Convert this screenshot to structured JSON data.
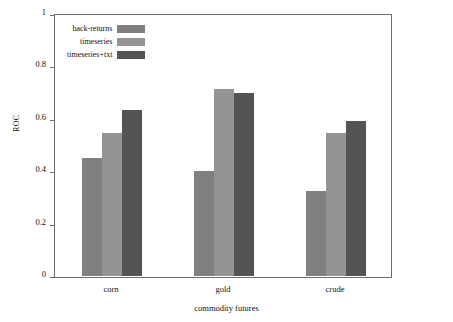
{
  "chart_data": {
    "type": "bar",
    "title": "",
    "xlabel": "commodity futures",
    "ylabel": "ROC",
    "categories": [
      "corn",
      "gold",
      "crude"
    ],
    "series": [
      {
        "name": "back-returns",
        "color": "#808080",
        "values": [
          0.45,
          0.4,
          0.325
        ]
      },
      {
        "name": "timeseries",
        "color": "#949494",
        "values": [
          0.545,
          0.715,
          0.545
        ]
      },
      {
        "name": "timeseries+txt",
        "color": "#545454",
        "values": [
          0.635,
          0.7,
          0.59
        ]
      }
    ],
    "ylim": [
      0,
      1
    ],
    "yticks": [
      "0",
      "0.2",
      "0.4",
      "0.6",
      "0.8",
      "1"
    ],
    "ytick_values": [
      0,
      0.2,
      0.4,
      0.6,
      0.8,
      1
    ],
    "grid": false,
    "legend_position": "upper-left",
    "frame": true,
    "background_color": "#ffffff",
    "axis_color": "#6d6d6d"
  }
}
